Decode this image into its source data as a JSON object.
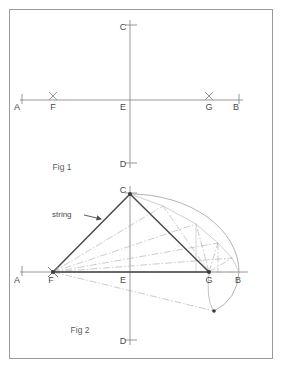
{
  "figure": {
    "border_color": "#9a9a9a",
    "axis_color": "#8c8c8c",
    "construction_color": "#9e9e9e",
    "string_color": "#4a4a4a",
    "label_color": "#4a4a4a"
  },
  "fig1": {
    "caption": "Fig 1",
    "labels": {
      "A": "A",
      "B": "B",
      "C": "C",
      "D": "D",
      "E": "E",
      "F": "F",
      "G": "G"
    },
    "points": {
      "A": {
        "x": 20,
        "y": 100
      },
      "B": {
        "x": 239,
        "y": 100
      },
      "C": {
        "x": 130,
        "y": 26
      },
      "D": {
        "x": 130,
        "y": 163
      },
      "E": {
        "x": 130,
        "y": 100
      },
      "F": {
        "x": 53,
        "y": 100
      },
      "G": {
        "x": 209,
        "y": 100
      }
    },
    "markers": {
      "F": "x-cross",
      "G": "x-cross",
      "A": "tick",
      "B": "tick",
      "C": "tick",
      "D": "tick"
    }
  },
  "fig2": {
    "caption": "Fig 2",
    "string_label": "string",
    "labels": {
      "A": "A",
      "B": "B",
      "C": "C",
      "D": "D",
      "E": "E",
      "F": "F",
      "G": "G"
    },
    "points": {
      "A": {
        "x": 20,
        "y": 272
      },
      "B": {
        "x": 239,
        "y": 272
      },
      "C": {
        "x": 130,
        "y": 194
      },
      "D": {
        "x": 130,
        "y": 340
      },
      "E": {
        "x": 130,
        "y": 272
      },
      "F": {
        "x": 53,
        "y": 272
      },
      "G": {
        "x": 209,
        "y": 272
      }
    },
    "markers": {
      "F": "x-cross-dot",
      "G": "dot",
      "C": "dot",
      "A": "tick",
      "D": "tick"
    },
    "string_triangle": [
      "F",
      "C",
      "G"
    ],
    "ellipse": {
      "center": {
        "x": 130,
        "y": 272
      },
      "semi_major": 109,
      "semi_minor": 78,
      "arc_description": "upper right quadrant arc from C through B continuing below axis"
    },
    "ray_count_from_F": 7,
    "description": "Two foci F and G with a taut string passing through apex C traces the ellipse"
  }
}
